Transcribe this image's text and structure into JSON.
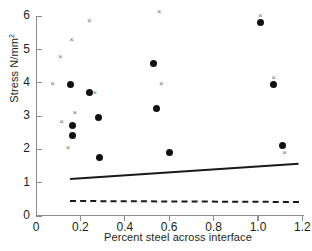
{
  "chart_data": {
    "type": "scatter",
    "title": "",
    "xlabel": "Percent steel across interface",
    "ylabel": "Stress N/mm",
    "ylabel_superscript": "2",
    "xlim": [
      0,
      1.25
    ],
    "ylim": [
      0,
      6.3
    ],
    "xticks": [
      0,
      0.2,
      0.4,
      0.6,
      0.8,
      1.0,
      1.2
    ],
    "xticklabels": [
      "0",
      "0.2",
      "0.4",
      "0.6",
      "0.8",
      "1.0",
      "1.2"
    ],
    "yticks": [
      0,
      1,
      2,
      3,
      4,
      5,
      6
    ],
    "yticklabels": [
      "0",
      "1",
      "2",
      "3",
      "4",
      "5",
      "6"
    ],
    "grid": false,
    "legend": "none",
    "series": [
      {
        "name": "filled-circle",
        "marker": "circle",
        "color": "#111111",
        "points": [
          {
            "x": 0.155,
            "y": 3.96
          },
          {
            "x": 0.24,
            "y": 3.72
          },
          {
            "x": 0.165,
            "y": 2.72
          },
          {
            "x": 0.28,
            "y": 2.96
          },
          {
            "x": 0.165,
            "y": 2.43
          },
          {
            "x": 0.285,
            "y": 1.76
          },
          {
            "x": 0.53,
            "y": 4.58
          },
          {
            "x": 0.545,
            "y": 3.22
          },
          {
            "x": 0.6,
            "y": 1.9
          },
          {
            "x": 1.01,
            "y": 5.8
          },
          {
            "x": 1.07,
            "y": 3.96
          },
          {
            "x": 1.11,
            "y": 2.13
          }
        ]
      },
      {
        "name": "cross",
        "marker": "x",
        "glyph": "×",
        "color": "#6e6e6e",
        "points": [
          {
            "x": 0.24,
            "y": 5.87
          },
          {
            "x": 0.16,
            "y": 5.3
          },
          {
            "x": 0.11,
            "y": 4.78
          },
          {
            "x": 0.075,
            "y": 3.97
          },
          {
            "x": 0.265,
            "y": 3.72
          },
          {
            "x": 0.175,
            "y": 3.12
          },
          {
            "x": 0.115,
            "y": 2.84
          },
          {
            "x": 0.145,
            "y": 2.06
          },
          {
            "x": 0.555,
            "y": 6.15
          },
          {
            "x": 0.565,
            "y": 3.98
          },
          {
            "x": 1.01,
            "y": 6.02
          },
          {
            "x": 1.07,
            "y": 4.15
          },
          {
            "x": 1.12,
            "y": 1.92
          }
        ]
      }
    ],
    "lines": [
      {
        "name": "solid-trend-line",
        "style": "solid",
        "color": "#1a1a1a",
        "x0": 0.155,
        "y0": 1.14,
        "x1": 1.185,
        "y1": 1.6
      },
      {
        "name": "dashed-trend-line",
        "style": "dashed",
        "color": "#1a1a1a",
        "x0": 0.155,
        "y0": 0.48,
        "x1": 1.185,
        "y1": 0.45
      }
    ]
  }
}
